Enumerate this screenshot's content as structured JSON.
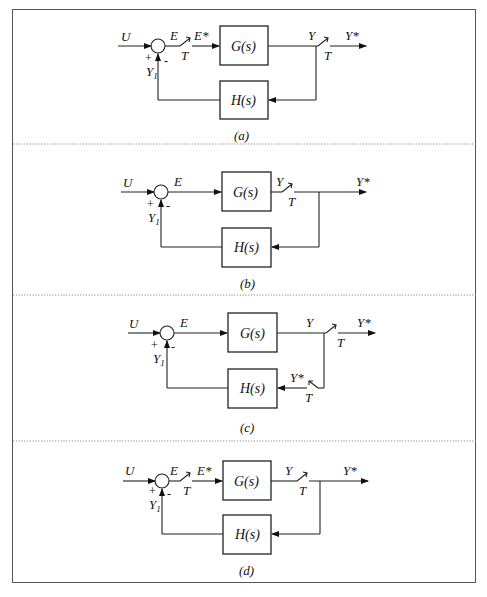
{
  "figure": {
    "panels": [
      {
        "id": "a",
        "caption": "(a)",
        "input": "U",
        "error": "E",
        "sampled_error": "E*",
        "forward_block": "G(s)",
        "output": "Y",
        "sampled_output": "Y*",
        "feedback_block": "H(s)",
        "feedback_signal": "Y",
        "feedback_sub": "1",
        "plus": "+",
        "minus": "-",
        "sampler": "T",
        "sampler2": "T"
      },
      {
        "id": "b",
        "caption": "(b)",
        "input": "U",
        "error": "E",
        "forward_block": "G(s)",
        "output": "Y",
        "sampled_output": "Y*",
        "feedback_block": "H(s)",
        "feedback_signal": "Y",
        "feedback_sub": "1",
        "plus": "+",
        "minus": "-",
        "sampler": "T"
      },
      {
        "id": "c",
        "caption": "(c)",
        "input": "U",
        "error": "E",
        "forward_block": "G(s)",
        "output": "Y",
        "sampled_output": "Y*",
        "feedback_block": "H(s)",
        "feedback_sampled": "Y*",
        "feedback_signal": "Y",
        "feedback_sub": "1",
        "plus": "+",
        "minus": "-",
        "sampler": "T",
        "sampler2": "T"
      },
      {
        "id": "d",
        "caption": "(d)",
        "input": "U",
        "error": "E",
        "sampled_error": "E*",
        "forward_block": "G(s)",
        "output": "Y",
        "sampled_output": "Y*",
        "feedback_block": "H(s)",
        "feedback_signal": "Y",
        "feedback_sub": "1",
        "plus": "+",
        "minus": "-",
        "sampler": "T",
        "sampler2": "T"
      }
    ]
  }
}
